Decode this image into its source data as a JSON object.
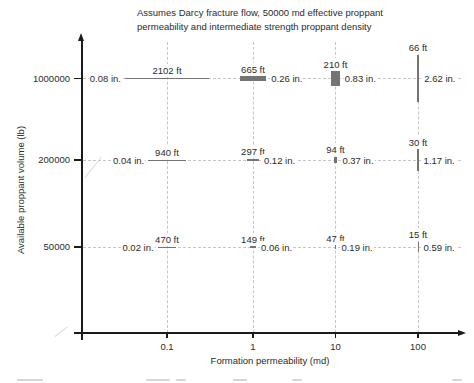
{
  "figure": {
    "title_line1": "Assumes Darcy fracture flow, 50000 md effective proppant",
    "title_line2": "permeability and intermediate strength proppant density"
  },
  "chart_data": {
    "type": "scatter",
    "title": "Assumes Darcy fracture flow, 50000 md effective proppant permeability and intermediate strength proppant density",
    "xlabel": "Formation permeability (md)",
    "ylabel": "Available proppant volume (lb)",
    "x_scale": "log",
    "x_ticks": [
      "0.1",
      "1",
      "10",
      "100"
    ],
    "y_ticks_top_to_bottom": [
      "1000000",
      "200000",
      "50000"
    ],
    "marker_encoding": "Each marker is a bar: horizontal extent = fracture length (ft), vertical extent = fracture width (in.)",
    "points": [
      {
        "perm_md": 0.1,
        "volume_lb": 1000000,
        "length_ft": 2102,
        "width_in": 0.08,
        "length_label": "2102 ft",
        "width_label": "0.08 in.",
        "width_label_side": "left"
      },
      {
        "perm_md": 1,
        "volume_lb": 1000000,
        "length_ft": 665,
        "width_in": 0.26,
        "length_label": "665 ft",
        "width_label": "0.26 in.",
        "width_label_side": "right"
      },
      {
        "perm_md": 10,
        "volume_lb": 1000000,
        "length_ft": 210,
        "width_in": 0.83,
        "length_label": "210 ft",
        "width_label": "0.83 in.",
        "width_label_side": "right"
      },
      {
        "perm_md": 100,
        "volume_lb": 1000000,
        "length_ft": 66,
        "width_in": 2.62,
        "length_label": "66 ft",
        "width_label": "2.62 in.",
        "width_label_side": "right"
      },
      {
        "perm_md": 0.1,
        "volume_lb": 200000,
        "length_ft": 940,
        "width_in": 0.04,
        "length_label": "940 ft",
        "width_label": "0.04 in.",
        "width_label_side": "left"
      },
      {
        "perm_md": 1,
        "volume_lb": 200000,
        "length_ft": 297,
        "width_in": 0.12,
        "length_label": "297 ft",
        "width_label": "0.12 in.",
        "width_label_side": "right"
      },
      {
        "perm_md": 10,
        "volume_lb": 200000,
        "length_ft": 94,
        "width_in": 0.37,
        "length_label": "94 ft",
        "width_label": "0.37 in.",
        "width_label_side": "right"
      },
      {
        "perm_md": 100,
        "volume_lb": 200000,
        "length_ft": 30,
        "width_in": 1.17,
        "length_label": "30 ft",
        "width_label": "1.17 in.",
        "width_label_side": "right"
      },
      {
        "perm_md": 0.1,
        "volume_lb": 50000,
        "length_ft": 470,
        "width_in": 0.02,
        "length_label": "470 ft",
        "width_label": "0.02 in.",
        "width_label_side": "left"
      },
      {
        "perm_md": 1,
        "volume_lb": 50000,
        "length_ft": 149,
        "width_in": 0.06,
        "length_label": "149 ft",
        "width_label": "0.06 in.",
        "width_label_side": "right"
      },
      {
        "perm_md": 10,
        "volume_lb": 50000,
        "length_ft": 47,
        "width_in": 0.19,
        "length_label": "47 ft",
        "width_label": "0.19 in.",
        "width_label_side": "right"
      },
      {
        "perm_md": 100,
        "volume_lb": 50000,
        "length_ft": 15,
        "width_in": 0.59,
        "length_label": "15 ft",
        "width_label": "0.59 in.",
        "width_label_side": "right"
      }
    ]
  },
  "colors": {
    "bar": "#747474",
    "axis": "#1b1b1b",
    "grid": "#c6c6c6",
    "text": "#2b2b2b",
    "background": "#ffffff"
  }
}
